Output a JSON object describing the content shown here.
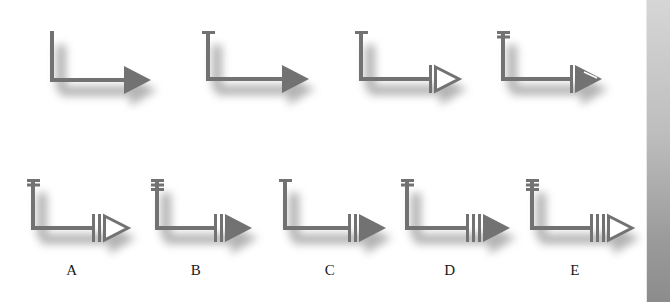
{
  "colors": {
    "stroke": "#727272",
    "shadow": "#9a9a9a",
    "background": "#ffffff"
  },
  "figures": [
    {
      "id": "r1-1",
      "row": 1,
      "x": 52,
      "top": 31,
      "y": 80,
      "end": 124,
      "top_bars": 0,
      "mid_bars": 0,
      "head": "filled",
      "head_slash": false,
      "label": ""
    },
    {
      "id": "r1-2",
      "row": 1,
      "x": 208,
      "top": 31,
      "y": 79,
      "end": 282,
      "top_bars": 1,
      "mid_bars": 0,
      "head": "filled",
      "head_slash": false,
      "label": ""
    },
    {
      "id": "r1-3",
      "row": 1,
      "x": 361,
      "top": 31,
      "y": 79,
      "end": 429,
      "top_bars": 1,
      "mid_bars": 1,
      "head": "open",
      "head_slash": false,
      "label": ""
    },
    {
      "id": "r1-4",
      "row": 1,
      "x": 503,
      "top": 31,
      "y": 79,
      "end": 570,
      "top_bars": 2,
      "mid_bars": 1,
      "head": "filled",
      "head_slash": true,
      "label": ""
    },
    {
      "id": "A",
      "row": 2,
      "x": 33,
      "top": 179,
      "y": 228,
      "end": 92,
      "top_bars": 2,
      "mid_bars": 2,
      "head": "open",
      "head_slash": false,
      "label": "A"
    },
    {
      "id": "B",
      "row": 2,
      "x": 157,
      "top": 179,
      "y": 228,
      "end": 214,
      "top_bars": 3,
      "mid_bars": 2,
      "head": "filled",
      "head_slash": false,
      "label": "B"
    },
    {
      "id": "C",
      "row": 2,
      "x": 285,
      "top": 179,
      "y": 228,
      "end": 348,
      "top_bars": 1,
      "mid_bars": 2,
      "head": "filled",
      "head_slash": false,
      "label": "C"
    },
    {
      "id": "D",
      "row": 2,
      "x": 407,
      "top": 179,
      "y": 228,
      "end": 466,
      "top_bars": 2,
      "mid_bars": 3,
      "head": "filled",
      "head_slash": false,
      "label": "D"
    },
    {
      "id": "E",
      "row": 2,
      "x": 532,
      "top": 179,
      "y": 228,
      "end": 590,
      "top_bars": 3,
      "mid_bars": 3,
      "head": "open",
      "head_slash": false,
      "label": "E"
    }
  ],
  "labels": [
    {
      "text": "A",
      "x": 72,
      "y": 262
    },
    {
      "text": "B",
      "x": 196,
      "y": 262
    },
    {
      "text": "C",
      "x": 330,
      "y": 262
    },
    {
      "text": "D",
      "x": 450,
      "y": 262
    },
    {
      "text": "E",
      "x": 575,
      "y": 262
    }
  ]
}
